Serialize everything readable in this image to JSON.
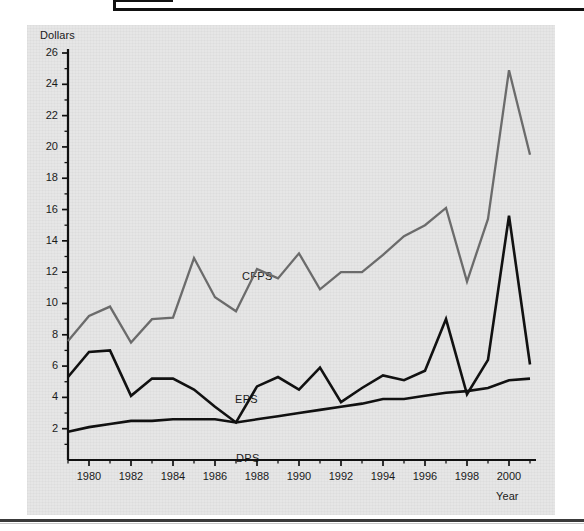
{
  "page": {
    "background_color": "#ffffff",
    "panel_color": "#e6e6e6",
    "frame_color": "#111111"
  },
  "chart_data": {
    "type": "line",
    "title": "",
    "subtitle": "",
    "xlabel": "Year",
    "ylabel": "Dollars",
    "xlim": [
      1979,
      2001
    ],
    "ylim": [
      0,
      26
    ],
    "grid": false,
    "legend": "inline-labels",
    "y_ticks": [
      0,
      2,
      4,
      6,
      8,
      10,
      12,
      14,
      16,
      18,
      20,
      22,
      24,
      26
    ],
    "y_tick_labels": [
      "2",
      "4",
      "6",
      "8",
      "10",
      "12",
      "14",
      "16",
      "18",
      "20",
      "22",
      "24",
      "26"
    ],
    "y_minor_tick_step": 1,
    "x_ticks": [
      1980,
      1982,
      1984,
      1986,
      1988,
      1990,
      1992,
      1994,
      1996,
      1998,
      2000
    ],
    "x_tick_labels": [
      "1980",
      "1982",
      "1984",
      "1986",
      "1988",
      "1990",
      "1992",
      "1994",
      "1996",
      "1998",
      "2000"
    ],
    "x_minor_tick_step": 1,
    "x": [
      1979,
      1980,
      1981,
      1982,
      1983,
      1984,
      1985,
      1986,
      1987,
      1988,
      1989,
      1990,
      1991,
      1992,
      1993,
      1994,
      1995,
      1996,
      1997,
      1998,
      1999,
      2000,
      2001
    ],
    "series": [
      {
        "name": "CFPS",
        "color": "#6b6b6b",
        "label_text": "CFPS",
        "values": [
          7.6,
          9.2,
          9.8,
          7.5,
          9.0,
          9.1,
          12.9,
          10.4,
          9.5,
          12.2,
          11.6,
          13.2,
          10.9,
          12.0,
          12.0,
          13.1,
          14.3,
          15.0,
          16.1,
          11.4,
          15.4,
          24.9,
          19.5
        ]
      },
      {
        "name": "EPS",
        "color": "#111111",
        "label_text": "EPS",
        "values": [
          5.3,
          6.9,
          7.0,
          4.1,
          5.2,
          5.2,
          4.5,
          3.4,
          2.4,
          4.7,
          5.3,
          4.5,
          5.9,
          3.7,
          4.6,
          5.4,
          5.1,
          5.7,
          9.0,
          4.2,
          6.4,
          15.6,
          6.1
        ]
      },
      {
        "name": "DPS",
        "color": "#111111",
        "label_text": "DPS",
        "values": [
          1.8,
          2.1,
          2.3,
          2.5,
          2.5,
          2.6,
          2.6,
          2.6,
          2.4,
          2.6,
          2.8,
          3.0,
          3.2,
          3.4,
          3.6,
          3.9,
          3.9,
          4.1,
          4.3,
          4.4,
          4.6,
          5.1,
          5.2
        ]
      }
    ]
  }
}
